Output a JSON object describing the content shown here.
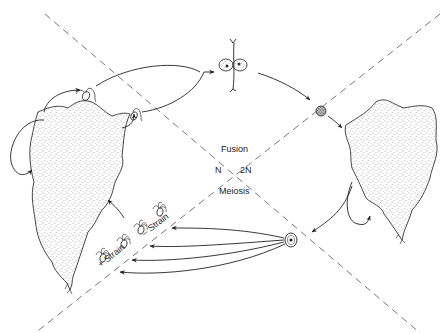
{
  "diagram": {
    "type": "life-cycle",
    "labels": {
      "fusion": "Fusion",
      "haploid": "N",
      "diploid": "2N",
      "meiosis": "Meiosis",
      "plus_strain": "+ Strain",
      "minus_strain": "– Strain"
    },
    "regions": [
      {
        "id": "haploid",
        "label": "N",
        "side": "left"
      },
      {
        "id": "diploid",
        "label": "2N",
        "side": "right"
      }
    ],
    "nodes": [
      {
        "id": "haploid-thallus",
        "description": "stippled haploid thallus, left"
      },
      {
        "id": "gametes",
        "description": "biflagellate gametes released from haploid thallus"
      },
      {
        "id": "fusing-gametes",
        "description": "pair of gametes fusing"
      },
      {
        "id": "zygote",
        "description": "dark stippled zygote"
      },
      {
        "id": "diploid-thallus",
        "description": "stippled diploid thallus, right"
      },
      {
        "id": "zoospore-cell",
        "description": "sporangium cell with nucleus"
      },
      {
        "id": "zoospores",
        "description": "quadriflagellate zoospores, + and – strains"
      }
    ],
    "edges": [
      {
        "from": "haploid-thallus",
        "to": "gametes"
      },
      {
        "from": "gametes",
        "to": "fusing-gametes",
        "label": "Fusion"
      },
      {
        "from": "fusing-gametes",
        "to": "zygote"
      },
      {
        "from": "zygote",
        "to": "diploid-thallus"
      },
      {
        "from": "diploid-thallus",
        "to": "diploid-thallus",
        "note": "self loop"
      },
      {
        "from": "diploid-thallus",
        "to": "zoospore-cell"
      },
      {
        "from": "zoospore-cell",
        "to": "zoospores",
        "label": "Meiosis"
      },
      {
        "from": "zoospores",
        "to": "haploid-thallus"
      },
      {
        "from": "haploid-thallus",
        "to": "haploid-thallus",
        "note": "self loop"
      }
    ]
  }
}
